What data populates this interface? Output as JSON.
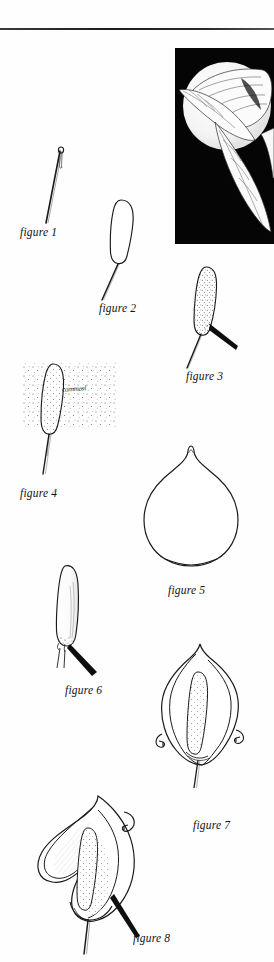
{
  "page": {
    "background_color": "#ffffff",
    "ink_color": "#1a1a1a",
    "rule_color": "#2a2a2a"
  },
  "photo": {
    "name": "calla-lily-photograph",
    "background_color": "#050505",
    "subject": "calla lily flower with leaves on black background",
    "alt_text": "Black and white photograph of a calla lily bloom and leaves"
  },
  "annotations": {
    "handwritten_note": "cornmeal"
  },
  "figures": [
    {
      "id": "figure-1",
      "caption": "figure 1",
      "subject": "needle with eye and thread wire",
      "caption_x": 20,
      "caption_y": 232
    },
    {
      "id": "figure-2",
      "caption": "figure 2",
      "subject": "plain rounded spadix form on wire stem",
      "caption_x": 99,
      "caption_y": 308
    },
    {
      "id": "figure-3",
      "caption": "figure 3",
      "subject": "stippled spadix with dark wedge tool on wire",
      "caption_x": 186,
      "caption_y": 376
    },
    {
      "id": "figure-4",
      "caption": "figure 4",
      "subject": "spadix dusted with cornmeal scatter",
      "caption_x": 20,
      "caption_y": 493
    },
    {
      "id": "figure-5",
      "caption": "figure 5",
      "subject": "flat spathe petal pattern piece",
      "caption_x": 168,
      "caption_y": 590
    },
    {
      "id": "figure-6",
      "caption": "figure 6",
      "subject": "finished spadix on stem with dark wedge",
      "caption_x": 65,
      "caption_y": 690
    },
    {
      "id": "figure-7",
      "caption": "figure 7",
      "subject": "spathe wrapped around spadix with curl arrows",
      "caption_x": 193,
      "caption_y": 825
    },
    {
      "id": "figure-8",
      "caption": "figure 8",
      "subject": "completed calla lily with rolled spathe edge and curl arrow",
      "caption_x": 133,
      "caption_y": 938
    }
  ]
}
